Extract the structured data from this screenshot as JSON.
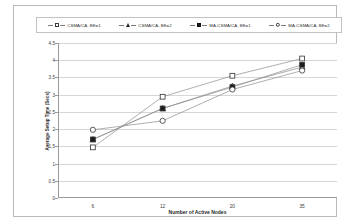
{
  "chart_data": {
    "type": "line",
    "title": "",
    "xlabel": "Number of Active Nodes",
    "ylabel": "Average Setup Time (Secs)",
    "categories": [
      "6",
      "12",
      "20",
      "35"
    ],
    "ylim": [
      0,
      4.5
    ],
    "yticks": [
      "0",
      "0.5",
      "1",
      "1.5",
      "2",
      "2.5",
      "3",
      "3.5",
      "4",
      "4.5"
    ],
    "ytick_values": [
      0,
      0.5,
      1,
      1.5,
      2,
      2.5,
      3,
      3.5,
      4,
      4.5
    ],
    "grid": true,
    "legend_position": "top",
    "series": [
      {
        "name": "CSMA/CA, BE=1",
        "marker": "square-open",
        "values": [
          1.47,
          2.94,
          3.55,
          4.05
        ]
      },
      {
        "name": "CSMA/CA, BE=2",
        "marker": "triangle-open",
        "values": [
          1.7,
          2.6,
          3.25,
          3.8
        ]
      },
      {
        "name": "MA-CSMA/CA, BE=1",
        "marker": "square-filled",
        "values": [
          1.7,
          2.6,
          3.22,
          3.87
        ]
      },
      {
        "name": "MA-CSMA/CA, BE=2",
        "marker": "circle-open",
        "values": [
          1.98,
          2.24,
          3.15,
          3.7
        ]
      }
    ],
    "colors": {
      "line": "#8c8c8c",
      "marker_edge": "#333333",
      "marker_fill_open": "#ffffff",
      "marker_fill_solid": "#1d1d1d",
      "grid": "#d6d6d6",
      "axis": "#9a9a9a",
      "background": "#ffffff"
    }
  },
  "legend": {
    "items": [
      {
        "label": "CSMA/CA, BE=1",
        "marker": "square-open"
      },
      {
        "label": "CSMA/CA, BE=2",
        "marker": "triangle-open"
      },
      {
        "label": "MA-CSMA/CA, BE=1",
        "marker": "square-filled"
      },
      {
        "label": "MA-CSMA/CA, BE=2",
        "marker": "circle-open"
      }
    ]
  }
}
